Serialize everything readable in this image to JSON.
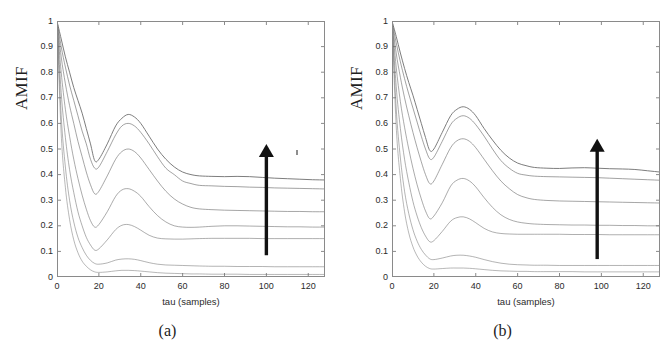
{
  "figure": {
    "panels": [
      {
        "caption": "(a)",
        "ylabel": "AMIF",
        "xlabel": "tau (samples)",
        "arrow": {
          "x": 100,
          "y0": 0.085,
          "y1": 0.52,
          "color": "#111111"
        }
      },
      {
        "caption": "(b)",
        "ylabel": "AMIF",
        "xlabel": "tau (samples)",
        "arrow": {
          "x": 98,
          "y0": 0.07,
          "y1": 0.54,
          "color": "#111111"
        }
      }
    ]
  },
  "chart_data": [
    {
      "type": "line",
      "title": "(a)",
      "xlabel": "tau (samples)",
      "ylabel": "AMIF",
      "xlim": [
        0,
        128
      ],
      "ylim": [
        0,
        1
      ],
      "xticks": [
        0,
        20,
        40,
        60,
        80,
        100,
        120
      ],
      "yticks": [
        0,
        0.1,
        0.2,
        0.3,
        0.4,
        0.5,
        0.6,
        0.7,
        0.8,
        0.9,
        1
      ],
      "grid": false,
      "legend": null,
      "annotation": "upward arrow at tau=100 indicating increasing noise/coupling level",
      "x": [
        0,
        2,
        4,
        6,
        8,
        10,
        12,
        14,
        16,
        18,
        20,
        24,
        28,
        31,
        34,
        37,
        40,
        44,
        48,
        52,
        56,
        60,
        64,
        68,
        74,
        80,
        86,
        92,
        98,
        104,
        110,
        116,
        122,
        128
      ],
      "series": [
        {
          "name": "curve-1-top",
          "values": [
            1.0,
            0.93,
            0.86,
            0.8,
            0.74,
            0.69,
            0.64,
            0.58,
            0.52,
            0.455,
            0.46,
            0.52,
            0.59,
            0.62,
            0.635,
            0.625,
            0.6,
            0.55,
            0.5,
            0.46,
            0.43,
            0.41,
            0.4,
            0.395,
            0.393,
            0.392,
            0.393,
            0.392,
            0.389,
            0.386,
            0.384,
            0.382,
            0.38,
            0.379
          ]
        },
        {
          "name": "curve-2",
          "values": [
            1.0,
            0.9,
            0.82,
            0.75,
            0.69,
            0.63,
            0.57,
            0.52,
            0.46,
            0.425,
            0.43,
            0.49,
            0.555,
            0.59,
            0.6,
            0.59,
            0.565,
            0.52,
            0.47,
            0.425,
            0.4,
            0.375,
            0.365,
            0.358,
            0.356,
            0.354,
            0.353,
            0.351,
            0.35,
            0.348,
            0.347,
            0.346,
            0.345,
            0.344
          ]
        },
        {
          "name": "curve-3",
          "values": [
            1.0,
            0.86,
            0.755,
            0.67,
            0.6,
            0.53,
            0.47,
            0.41,
            0.36,
            0.325,
            0.335,
            0.395,
            0.46,
            0.49,
            0.5,
            0.49,
            0.465,
            0.42,
            0.375,
            0.335,
            0.305,
            0.285,
            0.272,
            0.266,
            0.263,
            0.261,
            0.26,
            0.259,
            0.258,
            0.257,
            0.256,
            0.256,
            0.255,
            0.255
          ]
        },
        {
          "name": "curve-4",
          "values": [
            1.0,
            0.8,
            0.655,
            0.55,
            0.46,
            0.385,
            0.32,
            0.265,
            0.22,
            0.195,
            0.205,
            0.255,
            0.315,
            0.34,
            0.345,
            0.335,
            0.315,
            0.275,
            0.24,
            0.215,
            0.2,
            0.195,
            0.194,
            0.195,
            0.198,
            0.2,
            0.2,
            0.199,
            0.198,
            0.197,
            0.196,
            0.196,
            0.195,
            0.195
          ]
        },
        {
          "name": "curve-5",
          "values": [
            1.0,
            0.72,
            0.545,
            0.42,
            0.33,
            0.255,
            0.2,
            0.155,
            0.125,
            0.105,
            0.11,
            0.145,
            0.185,
            0.202,
            0.205,
            0.197,
            0.183,
            0.163,
            0.152,
            0.149,
            0.148,
            0.148,
            0.149,
            0.15,
            0.151,
            0.151,
            0.151,
            0.151,
            0.15,
            0.15,
            0.15,
            0.15,
            0.15,
            0.15
          ]
        },
        {
          "name": "curve-6",
          "values": [
            1.0,
            0.63,
            0.43,
            0.3,
            0.215,
            0.155,
            0.115,
            0.085,
            0.065,
            0.053,
            0.05,
            0.055,
            0.066,
            0.07,
            0.071,
            0.069,
            0.064,
            0.056,
            0.05,
            0.047,
            0.046,
            0.045,
            0.044,
            0.043,
            0.042,
            0.042,
            0.041,
            0.041,
            0.041,
            0.04,
            0.04,
            0.04,
            0.04,
            0.04
          ]
        },
        {
          "name": "curve-7-bottom",
          "values": [
            1.0,
            0.56,
            0.35,
            0.225,
            0.145,
            0.095,
            0.062,
            0.042,
            0.028,
            0.02,
            0.018,
            0.02,
            0.024,
            0.026,
            0.026,
            0.025,
            0.023,
            0.02,
            0.017,
            0.015,
            0.014,
            0.013,
            0.012,
            0.012,
            0.011,
            0.011,
            0.011,
            0.01,
            0.01,
            0.01,
            0.01,
            0.01,
            0.01,
            0.01
          ]
        }
      ],
      "plateau_values": [
        0.379,
        0.344,
        0.255,
        0.195,
        0.15,
        0.04,
        0.01
      ],
      "peak_values": [
        0.635,
        0.6,
        0.5,
        0.345,
        0.205,
        0.071,
        0.026
      ],
      "peak_tau": 34,
      "trough_tau": 18
    },
    {
      "type": "line",
      "title": "(b)",
      "xlabel": "tau (samples)",
      "ylabel": "AMIF",
      "xlim": [
        0,
        128
      ],
      "ylim": [
        0,
        1
      ],
      "xticks": [
        0,
        20,
        40,
        60,
        80,
        100,
        120
      ],
      "yticks": [
        0,
        0.1,
        0.2,
        0.3,
        0.4,
        0.5,
        0.6,
        0.7,
        0.8,
        0.9,
        1
      ],
      "grid": false,
      "legend": null,
      "annotation": "upward arrow at tau=98 indicating increasing noise/coupling level",
      "x": [
        0,
        2,
        4,
        6,
        8,
        10,
        12,
        14,
        16,
        18,
        20,
        24,
        28,
        31,
        34,
        37,
        40,
        44,
        48,
        52,
        56,
        60,
        64,
        68,
        74,
        80,
        86,
        92,
        98,
        104,
        110,
        116,
        122,
        128
      ],
      "series": [
        {
          "name": "curve-1-top",
          "values": [
            1.0,
            0.94,
            0.875,
            0.815,
            0.76,
            0.71,
            0.655,
            0.6,
            0.545,
            0.495,
            0.5,
            0.565,
            0.63,
            0.655,
            0.665,
            0.655,
            0.63,
            0.58,
            0.535,
            0.495,
            0.465,
            0.445,
            0.435,
            0.428,
            0.425,
            0.424,
            0.426,
            0.427,
            0.425,
            0.423,
            0.422,
            0.42,
            0.415,
            0.41
          ]
        },
        {
          "name": "curve-2",
          "values": [
            1.0,
            0.915,
            0.84,
            0.775,
            0.715,
            0.66,
            0.605,
            0.55,
            0.5,
            0.462,
            0.468,
            0.53,
            0.595,
            0.62,
            0.63,
            0.62,
            0.595,
            0.55,
            0.5,
            0.455,
            0.425,
            0.405,
            0.398,
            0.394,
            0.392,
            0.391,
            0.39,
            0.389,
            0.388,
            0.386,
            0.384,
            0.382,
            0.38,
            0.378
          ]
        },
        {
          "name": "curve-3",
          "values": [
            1.0,
            0.875,
            0.78,
            0.7,
            0.63,
            0.565,
            0.505,
            0.45,
            0.4,
            0.365,
            0.375,
            0.44,
            0.505,
            0.532,
            0.54,
            0.53,
            0.505,
            0.46,
            0.415,
            0.375,
            0.345,
            0.322,
            0.31,
            0.303,
            0.299,
            0.297,
            0.296,
            0.295,
            0.294,
            0.293,
            0.292,
            0.291,
            0.29,
            0.289
          ]
        },
        {
          "name": "curve-4",
          "values": [
            1.0,
            0.82,
            0.685,
            0.585,
            0.5,
            0.425,
            0.36,
            0.305,
            0.258,
            0.228,
            0.238,
            0.29,
            0.355,
            0.378,
            0.385,
            0.375,
            0.352,
            0.31,
            0.272,
            0.243,
            0.225,
            0.215,
            0.21,
            0.207,
            0.205,
            0.204,
            0.203,
            0.203,
            0.202,
            0.202,
            0.201,
            0.201,
            0.2,
            0.2
          ]
        },
        {
          "name": "curve-5",
          "values": [
            1.0,
            0.745,
            0.58,
            0.46,
            0.37,
            0.295,
            0.238,
            0.193,
            0.16,
            0.138,
            0.142,
            0.178,
            0.218,
            0.232,
            0.235,
            0.227,
            0.212,
            0.19,
            0.176,
            0.17,
            0.168,
            0.167,
            0.167,
            0.167,
            0.167,
            0.167,
            0.166,
            0.166,
            0.166,
            0.165,
            0.165,
            0.165,
            0.165,
            0.165
          ]
        },
        {
          "name": "curve-6",
          "values": [
            1.0,
            0.66,
            0.465,
            0.335,
            0.248,
            0.185,
            0.14,
            0.108,
            0.086,
            0.071,
            0.068,
            0.074,
            0.082,
            0.085,
            0.085,
            0.082,
            0.077,
            0.068,
            0.06,
            0.054,
            0.05,
            0.048,
            0.047,
            0.046,
            0.046,
            0.045,
            0.045,
            0.045,
            0.045,
            0.045,
            0.045,
            0.045,
            0.045,
            0.045
          ]
        },
        {
          "name": "curve-7-bottom",
          "values": [
            1.0,
            0.59,
            0.385,
            0.255,
            0.172,
            0.118,
            0.082,
            0.058,
            0.042,
            0.033,
            0.031,
            0.033,
            0.035,
            0.035,
            0.035,
            0.034,
            0.032,
            0.029,
            0.026,
            0.024,
            0.023,
            0.022,
            0.022,
            0.021,
            0.021,
            0.021,
            0.021,
            0.02,
            0.02,
            0.02,
            0.02,
            0.02,
            0.02,
            0.02
          ]
        }
      ],
      "plateau_values": [
        0.41,
        0.378,
        0.289,
        0.2,
        0.165,
        0.045,
        0.02
      ],
      "peak_values": [
        0.665,
        0.63,
        0.54,
        0.385,
        0.235,
        0.085,
        0.035
      ],
      "peak_tau": 34,
      "trough_tau": 19
    }
  ],
  "axes": {
    "ytick_labels": [
      "1",
      "0.9",
      "0.8",
      "0.7",
      "0.6",
      "0.5",
      "0.4",
      "0.3",
      "0.2",
      "0.1",
      "0"
    ],
    "xtick_labels": [
      "0",
      "20",
      "40",
      "60",
      "80",
      "100",
      "120"
    ]
  },
  "colors": {
    "axis": "#8a8a8a",
    "curve": "#6e6e6e",
    "arrow": "#111111",
    "text": "#2b2b2b",
    "background": "#ffffff"
  }
}
